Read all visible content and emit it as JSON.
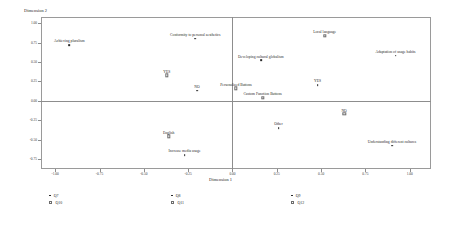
{
  "chart_data": {
    "type": "scatter",
    "title": "",
    "xlabel": "Dimension 1",
    "ylabel": "Dimension 2",
    "xlim": [
      -1.08,
      1.12
    ],
    "ylim": [
      -0.88,
      1.08
    ],
    "xticks": [
      "-1.00",
      "-0.75",
      "-0.50",
      "-0.25",
      "0.00",
      "0.25",
      "0.50",
      "0.75",
      "1.00"
    ],
    "xtickvals": [
      -1.0,
      -0.75,
      -0.5,
      -0.25,
      0.0,
      0.25,
      0.5,
      0.75,
      1.0
    ],
    "yticks": [
      "1.00",
      "0.75",
      "0.50",
      "0.25",
      "0.00",
      "-0.25",
      "-0.50",
      "-0.75"
    ],
    "ytickvals": [
      1.0,
      0.75,
      0.5,
      0.25,
      0.0,
      -0.25,
      -0.5,
      -0.75
    ],
    "grid": false,
    "reference_lines": {
      "horizontal_y": 0.0,
      "vertical_x": 0.0
    },
    "legend_position": "bottom",
    "points": [
      {
        "label": "Achieving pluralism",
        "x": -0.92,
        "y": 0.72,
        "marker": "filled"
      },
      {
        "label": "Conformity to personal aesthetics",
        "x": -0.21,
        "y": 0.8,
        "marker": "filled"
      },
      {
        "label": "YES",
        "x": -0.37,
        "y": 0.33,
        "marker": "hollow"
      },
      {
        "label": "NO",
        "x": -0.2,
        "y": 0.13,
        "marker": "filled"
      },
      {
        "label": "Personalized Buttons",
        "x": 0.02,
        "y": 0.16,
        "marker": "hollow"
      },
      {
        "label": "English",
        "x": -0.36,
        "y": -0.46,
        "marker": "hollow"
      },
      {
        "label": "Increase media usage",
        "x": -0.27,
        "y": -0.7,
        "marker": "filled"
      },
      {
        "label": "Developing cultural globalism",
        "x": 0.16,
        "y": 0.52,
        "marker": "filled"
      },
      {
        "label": "Local language",
        "x": 0.52,
        "y": 0.84,
        "marker": "hollow"
      },
      {
        "label": "Adaptation of usage habits",
        "x": 0.92,
        "y": 0.58,
        "marker": "filled"
      },
      {
        "label": "YES",
        "x": 0.48,
        "y": 0.2,
        "marker": "filled"
      },
      {
        "label": "Custom Function Buttons",
        "x": 0.17,
        "y": 0.04,
        "marker": "hollow"
      },
      {
        "label": "NO",
        "x": 0.63,
        "y": -0.17,
        "marker": "hollow"
      },
      {
        "label": "Other",
        "x": 0.26,
        "y": -0.35,
        "marker": "filled"
      },
      {
        "label": "Understanding different cultures",
        "x": 0.9,
        "y": -0.58,
        "marker": "filled"
      }
    ],
    "legend": [
      {
        "label": "Q7",
        "marker": "filled"
      },
      {
        "label": "Q10",
        "marker": "hollow"
      },
      {
        "label": "Q8",
        "marker": "filled"
      },
      {
        "label": "Q11",
        "marker": "hollow"
      },
      {
        "label": "Q9",
        "marker": "filled"
      },
      {
        "label": "Q12",
        "marker": "hollow"
      }
    ]
  },
  "colors": {
    "marker": "#2b2b2b",
    "frame": "#9a9a9a",
    "refline": "#8d8d8d",
    "text": "#1f1f1f",
    "background": "#ffffff"
  }
}
